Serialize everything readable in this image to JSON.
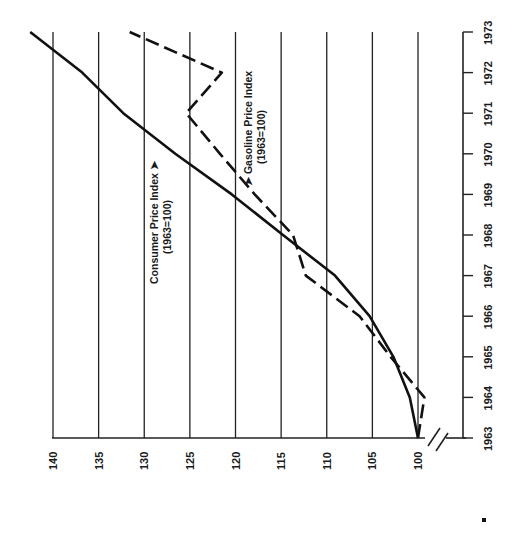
{
  "chart_data": {
    "type": "line",
    "orientation": "rotated-90-clockwise",
    "title": "",
    "xlabel": "Year",
    "ylabel": "Index (1963=100)",
    "x": [
      1963,
      1964,
      1965,
      1966,
      1967,
      1968,
      1969,
      1970,
      1971,
      1972,
      1973
    ],
    "x_tick_labels": [
      "1963",
      "1964",
      "1965",
      "1966",
      "1967",
      "1968",
      "1969",
      "1970",
      "1971",
      "1972",
      "1973"
    ],
    "y_ticks": [
      100,
      105,
      110,
      115,
      120,
      125,
      130,
      135,
      140
    ],
    "y_tick_labels": [
      "100",
      "105",
      "110",
      "115",
      "120",
      "125",
      "130",
      "135",
      "140"
    ],
    "ylim": [
      97,
      140
    ],
    "axis_break": true,
    "grid": true,
    "series": [
      {
        "name": "Consumer Price Index (1963=100)",
        "style": "solid",
        "values": [
          100,
          100.9,
          102.7,
          105.3,
          109.1,
          114.8,
          120.4,
          126.6,
          132.3,
          136.8,
          142.5
        ]
      },
      {
        "name": "Gasoline Price Index (1963=100)",
        "style": "dashed",
        "values": [
          100,
          99.3,
          103.0,
          106.4,
          112.3,
          113.7,
          117.9,
          121.7,
          125.4,
          121.5,
          131.6
        ]
      }
    ],
    "annotations": [
      {
        "text_line1": "Consumer Price Index",
        "text_line2": "(1963=100)",
        "arrow": "points to solid line"
      },
      {
        "text_line1": "Gasoline Price Index",
        "text_line2": "(1963=100)",
        "arrow": "points to dashed line"
      }
    ]
  },
  "labels": {
    "cpi_line1": "Consumer Price Index ➤",
    "cpi_line2": "(1963=100)",
    "gas_line1": "➤  Gasoline Price Index",
    "gas_line2": "(1963=100)"
  }
}
